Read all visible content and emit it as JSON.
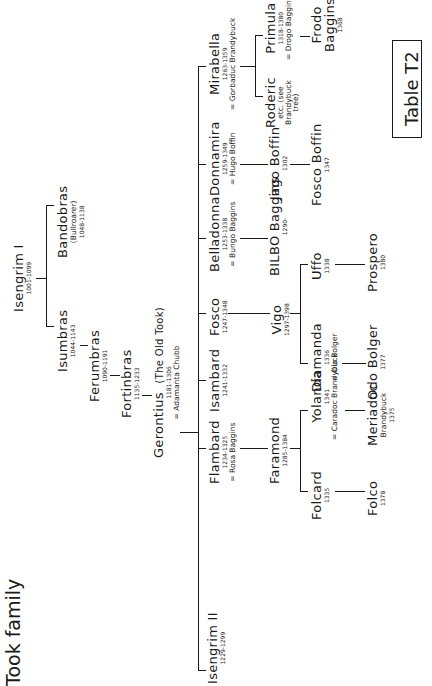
{
  "title": "Took family",
  "table_label": "Table T2",
  "people": {
    "isengrim1": {
      "name": "Isengrim I",
      "dates": "1001-1099"
    },
    "isumbras": {
      "name": "Isumbras",
      "dates": "1044-1143"
    },
    "bandobras": {
      "name": "Bandobras",
      "note": "(Bullroarer)",
      "dates": "1048-1138"
    },
    "ferumbras": {
      "name": "Ferumbras",
      "dates": "1090-1191"
    },
    "fortinbras": {
      "name": "Fortinbras",
      "dates": "1135-1233"
    },
    "gerontius": {
      "name": "Gerontius",
      "note": "(The Old Took)",
      "dates": "1181-1306",
      "spouse": "= Adamanta Chubb"
    },
    "mirabella": {
      "name": "Mirabella",
      "dates": "1263-1359",
      "spouse": "= Gorbaduc Brandybuck"
    },
    "roderic": {
      "name": "Roderic",
      "note": "etc. (see Brandybuck tree)"
    },
    "primula": {
      "name": "Primula",
      "dates": "1318-1380",
      "spouse": "= Drogo Baggins"
    },
    "frodo": {
      "name": "Frodo",
      "surname": "Baggins",
      "dates": "1368"
    },
    "donnamira": {
      "name": "Donnamira",
      "dates": "1259-1349",
      "spouse": "= Hugo Boffin"
    },
    "jago": {
      "name": "Jago Boffin",
      "dates": "1302"
    },
    "fosco_boffin": {
      "name": "Fosco Boffin",
      "dates": "1347"
    },
    "belladonna": {
      "name": "Belladonna",
      "dates": "1253-1338",
      "spouse": "= Bungo Baggins"
    },
    "bilbo": {
      "name": "BILBO Baggins",
      "dates": "1290-"
    },
    "fosco": {
      "name": "Fosco",
      "dates": "1247-1348"
    },
    "vigo": {
      "name": "Vigo",
      "dates": "1297-1398"
    },
    "uffo": {
      "name": "Uffo",
      "dates": "1338"
    },
    "prospero": {
      "name": "Prospero",
      "dates": "1380"
    },
    "diamanda": {
      "name": "Diamanda",
      "dates": "1336",
      "spouse": "= Olo Bolger"
    },
    "odo": {
      "name": "Odo Bolger",
      "dates": "1377"
    },
    "isambard": {
      "name": "Isambard",
      "dates": "1241-1332"
    },
    "flambard": {
      "name": "Flambard",
      "dates": "1234-1325",
      "spouse": "= Rosa Baggins"
    },
    "faramond": {
      "name": "Faramond",
      "dates": "1285-1384"
    },
    "folcard": {
      "name": "Folcard",
      "dates": "1335"
    },
    "folco": {
      "name": "Folco",
      "dates": "1378"
    },
    "yolanda": {
      "name": "Yolanda",
      "dates": "1341",
      "spouse": "= Caradoc Brandybuck"
    },
    "meriadoc": {
      "name": "Meriadoc",
      "surname": "Brandybuck",
      "dates": "1375"
    },
    "isengrim2": {
      "name": "Isengrim II",
      "dates": "1229-1299"
    }
  }
}
